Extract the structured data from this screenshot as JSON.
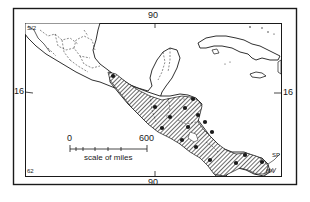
{
  "map": {
    "type": "distribution-map",
    "region": "Mexico and Central America",
    "colors": {
      "ink": "#1a1a1a",
      "paper": "#ffffff",
      "hatch": "#1a1a1a"
    },
    "graticule": {
      "top_longitude": "90",
      "bottom_longitude": "90",
      "left_latitude": "16",
      "right_latitude": "16"
    },
    "scale_bar": {
      "start_label": "0",
      "end_label": "600",
      "caption": "scale of miles"
    },
    "corner_annotations": {
      "top_left": "S/2",
      "bottom_left": "62",
      "bottom_right_a": "SP",
      "bottom_right_b": "SN"
    },
    "legend": {
      "hatched_area": "species range",
      "dots": "collection localities"
    },
    "locality_dots": [
      {
        "x": 113,
        "y": 76
      },
      {
        "x": 155,
        "y": 107
      },
      {
        "x": 170,
        "y": 117
      },
      {
        "x": 162,
        "y": 128
      },
      {
        "x": 185,
        "y": 108
      },
      {
        "x": 193,
        "y": 99
      },
      {
        "x": 198,
        "y": 115
      },
      {
        "x": 188,
        "y": 127
      },
      {
        "x": 205,
        "y": 122
      },
      {
        "x": 212,
        "y": 132
      },
      {
        "x": 182,
        "y": 140
      },
      {
        "x": 196,
        "y": 147
      },
      {
        "x": 210,
        "y": 160
      },
      {
        "x": 236,
        "y": 163
      },
      {
        "x": 245,
        "y": 155
      },
      {
        "x": 262,
        "y": 162
      }
    ]
  }
}
